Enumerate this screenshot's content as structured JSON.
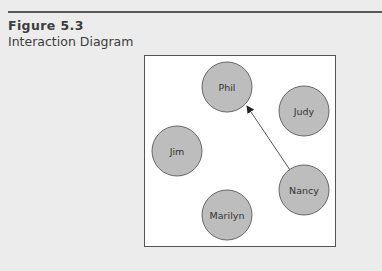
{
  "figure": {
    "number": "Figure 5.3",
    "title": "Interaction Diagram"
  },
  "colors": {
    "background": "#ececec",
    "box_fill": "#ffffff",
    "box_border": "#555555",
    "node_fill": "#bdbdbd",
    "node_stroke": "#666666",
    "arrow": "#555555",
    "text": "#3c3c3c"
  },
  "diagram": {
    "nodes": [
      {
        "id": "phil",
        "label": "Phil",
        "cx": 227,
        "cy": 87,
        "r": 25
      },
      {
        "id": "judy",
        "label": "Judy",
        "cx": 304,
        "cy": 111,
        "r": 25
      },
      {
        "id": "jim",
        "label": "Jim",
        "cx": 177,
        "cy": 151,
        "r": 25
      },
      {
        "id": "nancy",
        "label": "Nancy",
        "cx": 304,
        "cy": 190,
        "r": 25
      },
      {
        "id": "marilyn",
        "label": "Marilyn",
        "cx": 227,
        "cy": 215,
        "r": 25
      }
    ],
    "edges": [
      {
        "from": "Nancy",
        "to": "Phil",
        "directed": true
      }
    ]
  }
}
